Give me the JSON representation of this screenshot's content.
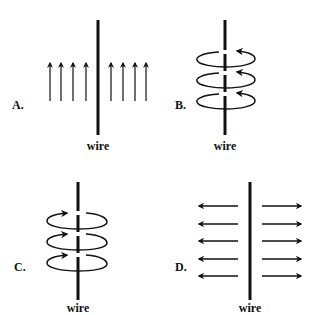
{
  "figure": {
    "type": "multiple-choice magnetic field diagram",
    "stroke_color": "#111111",
    "background_color": "#ffffff"
  },
  "panels": [
    {
      "id": "A",
      "label": "A.",
      "wire_label": "wire",
      "description": "Straight field lines parallel to the wire, pointing upward on both sides",
      "field_pattern": "parallel-up",
      "arrow_count_left": 4,
      "arrow_count_right": 4
    },
    {
      "id": "B",
      "label": "B.",
      "wire_label": "wire",
      "description": "Three circular loops around the wire, arrowheads at upper-right pointing left",
      "field_pattern": "circular-loops",
      "loop_count": 3,
      "arrow_direction": "counterclockwise-front-left"
    },
    {
      "id": "C",
      "label": "C.",
      "wire_label": "wire",
      "description": "Three circular loops around the wire, arrowheads at upper-left pointing right",
      "field_pattern": "circular-loops",
      "loop_count": 3,
      "arrow_direction": "clockwise-back-right"
    },
    {
      "id": "D",
      "label": "D.",
      "wire_label": "wire",
      "description": "Straight field lines perpendicular to the wire, pointing radially outward",
      "field_pattern": "radial-outward",
      "arrow_count_left": 5,
      "arrow_count_right": 5
    }
  ]
}
